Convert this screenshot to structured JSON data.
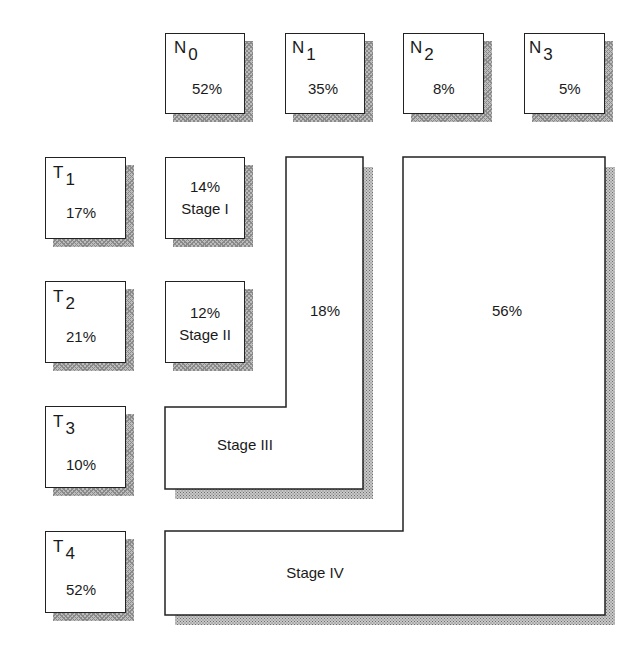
{
  "n_categories": [
    {
      "letter": "N",
      "sub": "0",
      "value": "52%"
    },
    {
      "letter": "N",
      "sub": "1",
      "value": "35%"
    },
    {
      "letter": "N",
      "sub": "2",
      "value": "8%"
    },
    {
      "letter": "N",
      "sub": "3",
      "value": "5%"
    }
  ],
  "t_categories": [
    {
      "letter": "T",
      "sub": "1",
      "value": "17%"
    },
    {
      "letter": "T",
      "sub": "2",
      "value": "21%"
    },
    {
      "letter": "T",
      "sub": "3",
      "value": "10%"
    },
    {
      "letter": "T",
      "sub": "4",
      "value": "52%"
    }
  ],
  "stages": {
    "stage1": {
      "value": "14%",
      "label": "Stage I"
    },
    "stage2": {
      "value": "12%",
      "label": "Stage II"
    },
    "stage3": {
      "value": "18%",
      "label": "Stage III"
    },
    "stage4": {
      "value": "56%",
      "label": "Stage IV"
    }
  },
  "colors": {
    "border": "#222222",
    "shadow": "#9a9a9a",
    "background": "#ffffff"
  }
}
